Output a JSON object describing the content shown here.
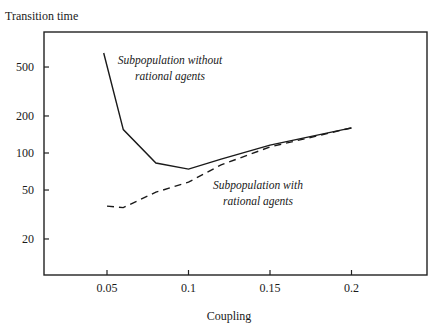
{
  "chart_data": {
    "type": "line",
    "title": "",
    "xlabel": "Coupling",
    "ylabel": "Transition time",
    "x_ticks": [
      0.05,
      0.1,
      0.15,
      0.2
    ],
    "x_tick_labels": [
      "0.05",
      "0.1",
      "0.15",
      "0.2"
    ],
    "y_ticks": [
      20,
      50,
      100,
      200,
      500
    ],
    "y_tick_labels": [
      "20",
      "50",
      "100",
      "200",
      "500"
    ],
    "y_scale": "log",
    "xlim": [
      0.0,
      0.235
    ],
    "ylim": [
      10,
      1150
    ],
    "grid": false,
    "legend_position": "inline annotations",
    "series": [
      {
        "name": "Subpopulation without rational agents",
        "style": "solid",
        "x": [
          0.048,
          0.06,
          0.08,
          0.1,
          0.12,
          0.15,
          0.2
        ],
        "values": [
          650,
          155,
          83,
          74,
          89,
          116,
          160
        ]
      },
      {
        "name": "Subpopulation with rational agents",
        "style": "dashed",
        "x": [
          0.05,
          0.06,
          0.08,
          0.1,
          0.12,
          0.15,
          0.2
        ],
        "values": [
          37,
          36,
          48,
          58,
          80,
          112,
          160
        ]
      }
    ],
    "annotations": [
      {
        "text": [
          "Subpopulation without",
          "rational agents"
        ],
        "series": 0
      },
      {
        "text": [
          "Subpopulation with",
          "rational agents"
        ],
        "series": 1
      }
    ]
  }
}
